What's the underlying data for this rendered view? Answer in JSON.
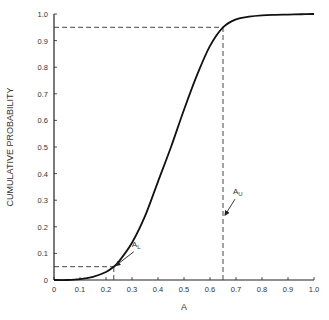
{
  "chart_data": {
    "type": "line",
    "title": "",
    "xlabel": "A",
    "ylabel": "CUMULATIVE PROBABILITY",
    "xlim": [
      0,
      1.0
    ],
    "ylim": [
      0,
      1.0
    ],
    "grid": false,
    "x_ticks": [
      "0",
      "0.1",
      "0.2",
      "0.3",
      "0.4",
      "0.5",
      "0.6",
      "0.7",
      "0.8",
      "0.9",
      "1.0"
    ],
    "y_ticks": [
      "0",
      "0.1",
      "0.2",
      "0.3",
      "0.4",
      "0.5",
      "0.6",
      "0.7",
      "0.8",
      "0.9",
      "1.0"
    ],
    "series": [
      {
        "name": "CDF",
        "x": [
          0,
          0.05,
          0.1,
          0.15,
          0.2,
          0.23,
          0.25,
          0.3,
          0.35,
          0.4,
          0.45,
          0.5,
          0.55,
          0.6,
          0.65,
          0.7,
          0.75,
          0.8,
          0.85,
          0.9,
          0.95,
          1.0
        ],
        "y": [
          0,
          0.0,
          0.003,
          0.012,
          0.03,
          0.05,
          0.07,
          0.14,
          0.24,
          0.37,
          0.5,
          0.64,
          0.77,
          0.88,
          0.95,
          0.98,
          0.99,
          0.995,
          0.997,
          0.998,
          0.999,
          1.0
        ]
      }
    ],
    "reference_lines": [
      {
        "name": "lower",
        "x": 0.23,
        "y": 0.05
      },
      {
        "name": "upper",
        "x": 0.65,
        "y": 0.95
      }
    ],
    "annotations": [
      {
        "label": "A",
        "subscript": "L",
        "points_to": {
          "x": 0.23,
          "y": 0.05
        }
      },
      {
        "label": "A",
        "subscript": "U",
        "points_to": {
          "x": 0.65,
          "y": 0.24
        }
      }
    ]
  }
}
